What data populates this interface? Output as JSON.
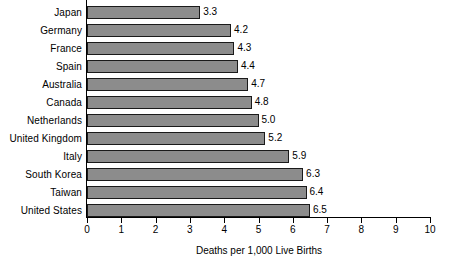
{
  "chart_data": {
    "type": "bar",
    "orientation": "horizontal",
    "title": "",
    "xlabel": "Deaths per 1,000 Live Births",
    "ylabel": "",
    "xlim": [
      0,
      10
    ],
    "xticks": [
      "0",
      "1",
      "2",
      "3",
      "4",
      "5",
      "6",
      "7",
      "8",
      "9",
      "10"
    ],
    "grid": false,
    "legend": null,
    "categories": [
      "Japan",
      "Germany",
      "France",
      "Spain",
      "Australia",
      "Canada",
      "Netherlands",
      "United Kingdom",
      "Italy",
      "South Korea",
      "Taiwan",
      "United States"
    ],
    "values": [
      3.3,
      4.2,
      4.3,
      4.4,
      4.7,
      4.8,
      5.0,
      5.2,
      5.9,
      6.3,
      6.4,
      6.5
    ],
    "value_labels": [
      "3.3",
      "4.2",
      "4.3",
      "4.4",
      "4.7",
      "4.8",
      "5.0",
      "5.2",
      "5.9",
      "6.3",
      "6.4",
      "6.5"
    ],
    "bar_color": "#8c8c8c",
    "bar_border_color": "#1a1a1a",
    "background_color": "#ffffff",
    "text_color": "#000000"
  }
}
